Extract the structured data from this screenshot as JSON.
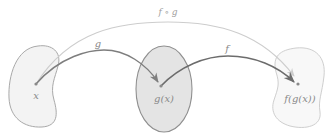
{
  "diagram": {
    "type": "function-composition",
    "sets": [
      {
        "id": "domain",
        "point_label": "x",
        "fill": "#f3f3f3",
        "stroke": "#a9a9a9"
      },
      {
        "id": "intermediate",
        "point_label": "g(x)",
        "fill": "#e4e4e4",
        "stroke": "#8f8f8f"
      },
      {
        "id": "codomain",
        "point_label": "f(g(x))",
        "fill": "#f8f8f8",
        "stroke": "#cfcfcf"
      }
    ],
    "arrows": [
      {
        "id": "g",
        "label": "g",
        "from": "x",
        "to": "g(x)",
        "color": "#7e7e7e"
      },
      {
        "id": "f",
        "label": "f",
        "from": "g(x)",
        "to": "f(g(x))",
        "color": "#6c6c6c"
      },
      {
        "id": "f-compose-g",
        "label": "f ∘ g",
        "from": "x",
        "to": "f(g(x))",
        "color": "#cdcdcd"
      }
    ]
  }
}
